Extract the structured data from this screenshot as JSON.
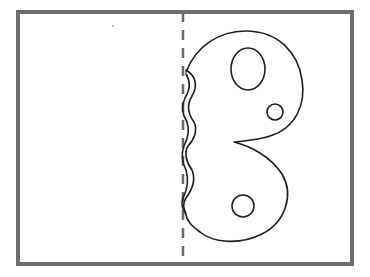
{
  "diagram": {
    "title": "Folded card with blob cut-out shape",
    "parts": {
      "frame": "card-outline",
      "fold_line": "dashed-fold-line",
      "shape": "blob-shape",
      "wavy_edge": "wavy-cut-edge",
      "holes": [
        "large-oval-hole",
        "small-circle-hole-right",
        "small-circle-hole-bottom"
      ]
    },
    "colors": {
      "frame": "#6e6e6e",
      "fold": "#6a6a6a",
      "ink": "#1e1e1e",
      "background": "#ffffff"
    }
  }
}
